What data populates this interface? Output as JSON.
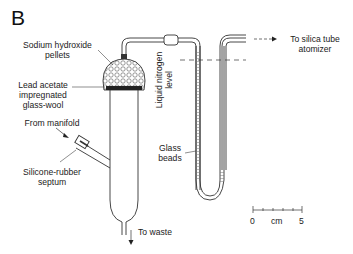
{
  "figure": {
    "panel_letter": "B",
    "labels": {
      "sodium_hydroxide_line1": "Sodium hydroxide",
      "sodium_hydroxide_line2": "pellets",
      "lead_acetate_line1": "Lead acetate",
      "lead_acetate_line2": "impregnated",
      "lead_acetate_line3": "glass-wool",
      "from_manifold": "From manifold",
      "septum_line1": "Silicone-rubber",
      "septum_line2": "septum",
      "to_waste": "To waste",
      "liquid_nitrogen_line1": "Liquid nitrogen",
      "liquid_nitrogen_line2": "level",
      "glass_beads_line1": "Glass",
      "glass_beads_line2": "beads",
      "to_silica_line1": "To silica tube",
      "to_silica_line2": "atomizer"
    },
    "scale_bar": {
      "start_label": "0",
      "unit_label": "cm",
      "end_label": "5"
    }
  }
}
